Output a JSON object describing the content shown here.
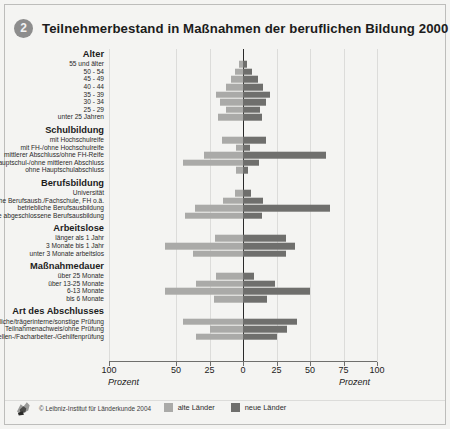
{
  "header": {
    "badge": "2",
    "title": "Teilnehmerbestand in Maßnahmen der beruflichen Bildung 2000"
  },
  "axis": {
    "ticks": [
      "100",
      "50",
      "25",
      "0",
      "25",
      "50",
      "75",
      "100"
    ],
    "unit_left": "Prozent",
    "unit_right": "Prozent"
  },
  "legend": {
    "items": [
      {
        "label": "alte Länder",
        "color": "#aaaaa8"
      },
      {
        "label": "neue Länder",
        "color": "#6f6f6d"
      }
    ]
  },
  "footer": {
    "copyright": "© Leibniz-Institut für Länderkunde 2004",
    "logo_name": "leibniz-institut-logo"
  },
  "chart_data": {
    "type": "bar",
    "orientation": "horizontal",
    "layout": "diverging-pyramid",
    "title": "Teilnehmerbestand in Maßnahmen der beruflichen Bildung 2000",
    "xlabel": "Prozent",
    "ylabel": "",
    "xlim": [
      -100,
      100
    ],
    "xticks": [
      -100,
      -50,
      -25,
      0,
      25,
      50,
      75,
      100
    ],
    "grid": true,
    "legend_position": "bottom",
    "series": [
      {
        "name": "alte Länder",
        "color": "#aaaaa8",
        "side": "left"
      },
      {
        "name": "neue Länder",
        "color": "#6f6f6d",
        "side": "right"
      }
    ],
    "groups": [
      {
        "title": "Alter",
        "categories": [
          "55 und älter",
          "50 - 54",
          "45 - 49",
          "40 - 44",
          "35 - 39",
          "30 - 34",
          "25 - 29",
          "unter 25 Jahren"
        ],
        "alte_laender": [
          3,
          6,
          9,
          13,
          20,
          17,
          13,
          19
        ],
        "neue_laender": [
          3,
          7,
          11,
          15,
          20,
          17,
          13,
          14
        ]
      },
      {
        "title": "Schulbildung",
        "categories": [
          "mit Hochschulreife",
          "mit FH-/ohne Hochschulreife",
          "mittlerer Abschluss/ohne FH-Reife",
          "mit Hauptschul-/ohne mittleren Abschluss",
          "ohne Hauptschulabschluss"
        ],
        "alte_laender": [
          16,
          5,
          29,
          45,
          5
        ],
        "neue_laender": [
          17,
          5,
          62,
          12,
          4
        ]
      },
      {
        "title": "Berufsbildung",
        "categories": [
          "Universität",
          "außerbetriebliche Berufsausb./Fachschule, FH o.ä.",
          "betriebliche Berufsausbildung",
          "ohne abgeschlossene Berufsausbildung"
        ],
        "alte_laender": [
          6,
          15,
          36,
          43
        ],
        "neue_laender": [
          6,
          15,
          65,
          14
        ]
      },
      {
        "title": "Arbeitslose",
        "categories": [
          "länger als 1 Jahr",
          "3 Monate bis 1 Jahr",
          "unter 3 Monate arbeitslos"
        ],
        "alte_laender": [
          21,
          58,
          37
        ],
        "neue_laender": [
          32,
          39,
          32
        ]
      },
      {
        "title": "Maßnahmedauer",
        "categories": [
          "über 25 Monate",
          "über 13-25 Monate",
          "6-13 Monate",
          "bis 6 Monate"
        ],
        "alte_laender": [
          20,
          35,
          58,
          22
        ],
        "neue_laender": [
          8,
          24,
          50,
          18
        ]
      },
      {
        "title": "Art des Abschlusses",
        "categories": [
          "staatliche/trägerinterne/sonstige Prüfung",
          "Teilnahmenachweis/ohne Prüfung",
          "Gesellen-/Facharbeiter-/Gehilfenprüfung"
        ],
        "alte_laender": [
          45,
          25,
          35
        ],
        "neue_laender": [
          40,
          33,
          25
        ]
      }
    ]
  }
}
